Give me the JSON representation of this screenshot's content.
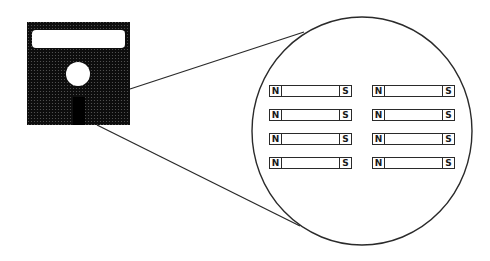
{
  "diagram": {
    "diskette": {
      "icon": "floppy-disk-icon",
      "body_color": "#111111",
      "label_color": "#ffffff"
    },
    "magnified_view": {
      "shape": "circle",
      "stroke_color": "#2a2a2a"
    },
    "magnets": {
      "north_label": "N",
      "south_label": "S",
      "columns": 2,
      "rows": 4,
      "items": [
        {
          "north": "N",
          "south": "S"
        },
        {
          "north": "N",
          "south": "S"
        },
        {
          "north": "N",
          "south": "S"
        },
        {
          "north": "N",
          "south": "S"
        },
        {
          "north": "N",
          "south": "S"
        },
        {
          "north": "N",
          "south": "S"
        },
        {
          "north": "N",
          "south": "S"
        },
        {
          "north": "N",
          "south": "S"
        }
      ]
    }
  }
}
